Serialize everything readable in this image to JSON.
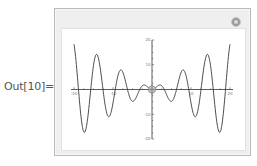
{
  "cell": {
    "output_label": "Out[10]="
  },
  "manipulate": {
    "options_icon": "plus-circle-icon",
    "locator_icon": "locator-crosshair-icon",
    "locator_position": [
      0,
      0
    ]
  },
  "chart_data": {
    "type": "line",
    "title": "",
    "function": "x Sin[x]",
    "xlabel": "",
    "ylabel": "",
    "xlim": [
      -20,
      20
    ],
    "ylim": [
      -20,
      20
    ],
    "x_ticks": [
      -20,
      -10,
      10,
      20
    ],
    "y_ticks": [
      20,
      10,
      -10,
      -20
    ],
    "grid": false,
    "series": [
      {
        "name": "x sin(x)",
        "color": "#3a3a3a",
        "x": [
          -20,
          -19,
          -18,
          -17,
          -16,
          -15,
          -14,
          -13,
          -12,
          -11,
          -10,
          -9,
          -8,
          -7,
          -6,
          -5,
          -4,
          -3,
          -2,
          -1,
          0,
          1,
          2,
          3,
          4,
          5,
          6,
          7,
          8,
          9,
          10,
          11,
          12,
          13,
          14,
          15,
          16,
          17,
          18,
          19,
          20
        ],
        "values": [
          18.26,
          2.85,
          -13.52,
          -16.34,
          -4.61,
          9.75,
          13.87,
          5.46,
          -6.44,
          -10.99,
          -5.44,
          3.71,
          7.91,
          4.6,
          -1.68,
          -4.79,
          -3.03,
          0.42,
          1.82,
          0.84,
          0,
          0.84,
          1.82,
          0.42,
          -3.03,
          -4.79,
          -1.68,
          4.6,
          7.91,
          3.71,
          -5.44,
          -10.99,
          -6.44,
          5.46,
          13.87,
          9.75,
          -4.61,
          -16.34,
          -13.52,
          2.85,
          18.26
        ]
      }
    ]
  }
}
